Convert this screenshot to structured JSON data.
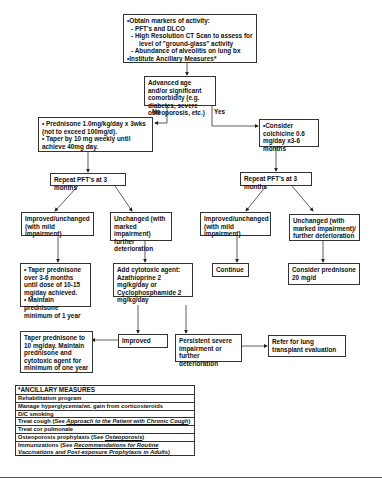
{
  "diagram": {
    "top_box": {
      "lines": [
        "•Obtain markers of activity:",
        "- PFT's and DLCO",
        "- High Resolution CT Scan to assess for",
        "level of \"ground-glass\" activity",
        "- Abundance of alveolitis on lung bx",
        "•Institute Ancillary Measures*"
      ]
    },
    "decision_box": {
      "text": "Advanced age and/or significant comorbidity (e.g. diabetes, severe osteoporosis, etc.)",
      "no_label": "No",
      "yes_label": "Yes"
    },
    "left_branch": {
      "prednisone_box": [
        "• Prednisone 1.0mg/kg/day x 3wks (not to exceed 100mg/d).",
        "• Taper by 10 mg weekly until achieve 40mg day."
      ],
      "repeat_pft": "Repeat PFT's at 3 months",
      "improved": "Improved/unchanged (with mild impairment)",
      "unchanged": "Unchanged (with marked impairment) further deterioration",
      "taper_box": [
        "• Taper prednisone over 3-6 months until dose of 10-15 mg/day achieved.",
        "• Maintain prednisone minimum of 1 year"
      ],
      "cytotoxic_box": "Add cytotoxic agent: Azathioprine 2 mg/kg/day or Cyclophosphamide 2 mg/kg/day",
      "improved_small": "Improved",
      "taper10_box": "Taper prednisone to 10 mg/day.  Maintain prednisone and cytotoxic agent for minimum of one year",
      "persistent_box": "Persistent severe impairment or further deterioration",
      "transplant_box": "Refer for lung transplant evaluation"
    },
    "right_branch": {
      "colchicine_box": "•Consider colchicine 0.6 mg/day x3-6 months",
      "repeat_pft": "Repeat PFT's at 3 months",
      "improved": "Improved/unchanged (with mild impairment)",
      "unchanged": "Unchanged (with marked impairment)/ further deterioration",
      "continue": "Continue",
      "consider_prednisone": "Consider prednisone 20 mg/d"
    },
    "ancillary": {
      "title": "*ANCILLARY MEASURES",
      "rows": [
        {
          "text": "Rehabilitation program"
        },
        {
          "text": "Manage hyperglycemia/wt. gain from   corticosteroids"
        },
        {
          "text": "D/C smoking"
        },
        {
          "text": "Treat cough (See ",
          "link": "Approach to the Patient with Chronic Cough",
          "after": ")"
        },
        {
          "text": "Treat cor pulmonale"
        },
        {
          "text": "Osteoporosis prophylaxis (See ",
          "link": "Osteoporosis",
          "after": ")"
        },
        {
          "text": "Immunizations (See ",
          "link": "Recommendations for Routine Vaccinations and Post-exposure Prophylaxis in Adults",
          "after": ")"
        }
      ]
    }
  }
}
